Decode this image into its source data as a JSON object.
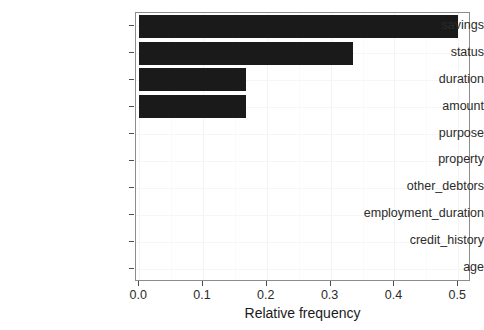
{
  "chart_data": {
    "type": "bar",
    "orientation": "horizontal",
    "title": "",
    "xlabel": "Relative frequency",
    "ylabel": "",
    "categories": [
      "savings",
      "status",
      "duration",
      "amount",
      "purpose",
      "property",
      "other_debtors",
      "employment_duration",
      "credit_history",
      "age"
    ],
    "values": [
      0.5,
      0.335,
      0.168,
      0.168,
      0.0,
      0.0,
      0.0,
      0.0,
      0.0,
      0.0
    ],
    "xlim": [
      -0.005,
      0.52
    ],
    "xticks": [
      0.0,
      0.1,
      0.2,
      0.3,
      0.4,
      0.5
    ],
    "xtick_labels": [
      "0.0",
      "0.1",
      "0.2",
      "0.3",
      "0.4",
      "0.5"
    ],
    "grid": true,
    "legend": "none",
    "bar_color": "#1a1a1a",
    "panel_border_color": "#8c8c8c",
    "background_color": "#ffffff"
  }
}
